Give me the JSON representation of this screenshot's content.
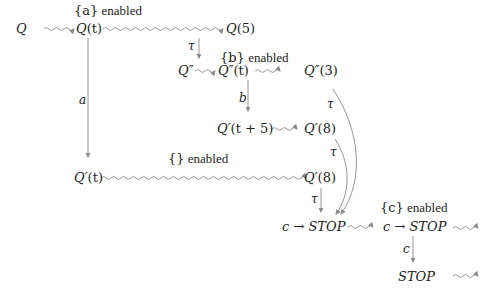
{
  "diagram": {
    "type": "timed-process-transition-diagram",
    "nodes": [
      {
        "id": "Q",
        "label": "Q",
        "x": 22,
        "y": 29
      },
      {
        "id": "Qt",
        "label": "Q(t)",
        "x": 88,
        "y": 29
      },
      {
        "id": "Q5",
        "label": "Q(5)",
        "x": 238,
        "y": 29
      },
      {
        "id": "Qpp",
        "label": "Q″",
        "x": 207,
        "y": 79
      },
      {
        "id": "Qppt",
        "label": "Q″(t)",
        "x": 250,
        "y": 79
      },
      {
        "id": "Qpp3",
        "label": "Q″(3)",
        "x": 322,
        "y": 79
      },
      {
        "id": "Qpt5",
        "label": "Q′(t + 5)",
        "x": 243,
        "y": 129
      },
      {
        "id": "Qp8a",
        "label": "Q′(8)",
        "x": 322,
        "y": 129
      },
      {
        "id": "Qpt",
        "label": "Q′(t)",
        "x": 88,
        "y": 178
      },
      {
        "id": "Qp8b",
        "label": "Q′(8)",
        "x": 322,
        "y": 178
      },
      {
        "id": "cstop1",
        "label": "c → STOP",
        "x": 312,
        "y": 228
      },
      {
        "id": "cstop2",
        "label": "c → STOP",
        "x": 412,
        "y": 228
      },
      {
        "id": "stop",
        "label": "STOP",
        "x": 412,
        "y": 278
      }
    ],
    "annotations": [
      {
        "id": "a_enabled",
        "label": "{a} enabled",
        "x": 90,
        "y": 10
      },
      {
        "id": "b_enabled",
        "label": "{b} enabled",
        "x": 245,
        "y": 59
      },
      {
        "id": "empty_enabled",
        "label": "{} enabled",
        "x": 190,
        "y": 158
      },
      {
        "id": "c_enabled",
        "label": "{c} enabled",
        "x": 415,
        "y": 208
      }
    ],
    "edges": [
      {
        "from": "Q",
        "to": "Qt",
        "style": "wavy",
        "label": ""
      },
      {
        "from": "Qt",
        "to": "Q5",
        "style": "wavy",
        "label": ""
      },
      {
        "from": "Q5",
        "to": "Qppt",
        "style": "straight",
        "label": "τ"
      },
      {
        "from": "Qpp",
        "to": "Qppt",
        "style": "wavy",
        "label": ""
      },
      {
        "from": "Qppt",
        "to": "Qpp3",
        "style": "wavy",
        "label": ""
      },
      {
        "from": "Qppt",
        "to": "Qpt5",
        "style": "straight",
        "label": "b"
      },
      {
        "from": "Qpt5",
        "to": "Qp8a",
        "style": "wavy",
        "label": ""
      },
      {
        "from": "Qt",
        "to": "Qpt",
        "style": "straight",
        "label": "a"
      },
      {
        "from": "Qpt",
        "to": "Qp8b",
        "style": "wavy",
        "label": ""
      },
      {
        "from": "Qp8b",
        "to": "cstop1",
        "style": "straight",
        "label": "τ"
      },
      {
        "from": "Qpp3",
        "to": "cstop1",
        "style": "curved",
        "label": "τ"
      },
      {
        "from": "Qp8a",
        "to": "cstop1",
        "style": "curved",
        "label": "τ"
      },
      {
        "from": "cstop1",
        "to": "cstop2",
        "style": "wavy",
        "label": ""
      },
      {
        "from": "cstop2",
        "to": "stop",
        "style": "straight",
        "label": "c"
      },
      {
        "from": "cstop2",
        "to": "out1",
        "style": "wavy",
        "label": ""
      },
      {
        "from": "stop",
        "to": "out2",
        "style": "wavy",
        "label": ""
      }
    ]
  },
  "labels": {
    "Q": "Q",
    "Qt_Q": "Q",
    "Qt_arg": "(t)",
    "Q5_Q": "Q",
    "Q5_arg": "(5)",
    "Qpp": "Q″",
    "Qppt_Q": "Q″",
    "Qppt_arg": "(t)",
    "Qpp3_Q": "Q″",
    "Qpp3_arg": "(3)",
    "Qpt5_Q": "Q′",
    "Qpt5_arg": "(t + 5)",
    "Qp8a_Q": "Q′",
    "Qp8a_arg": "(8)",
    "Qpt_Q": "Q′",
    "Qpt_arg": "(t)",
    "Qp8b_Q": "Q′",
    "Qp8b_arg": "(8)",
    "cstop1_c": "c",
    "cstop1_arrow": " → ",
    "cstop1_stop": "STOP",
    "cstop2_c": "c",
    "cstop2_arrow": " → ",
    "cstop2_stop": "STOP",
    "stop": "STOP",
    "a_enabled_set": "{a}",
    "a_enabled_word": " enabled",
    "b_enabled_set": "{b}",
    "b_enabled_word": " enabled",
    "empty_enabled_set": "{}",
    "empty_enabled_word": " enabled",
    "c_enabled_set": "{c}",
    "c_enabled_word": " enabled",
    "tau1": "τ",
    "tau2": "τ",
    "tau3": "τ",
    "tau4": "τ",
    "edge_a": "a",
    "edge_b": "b",
    "edge_c": "c"
  },
  "colors": {
    "stroke": "#8a8a8a",
    "text": "#222222",
    "background": "#ffffff"
  }
}
